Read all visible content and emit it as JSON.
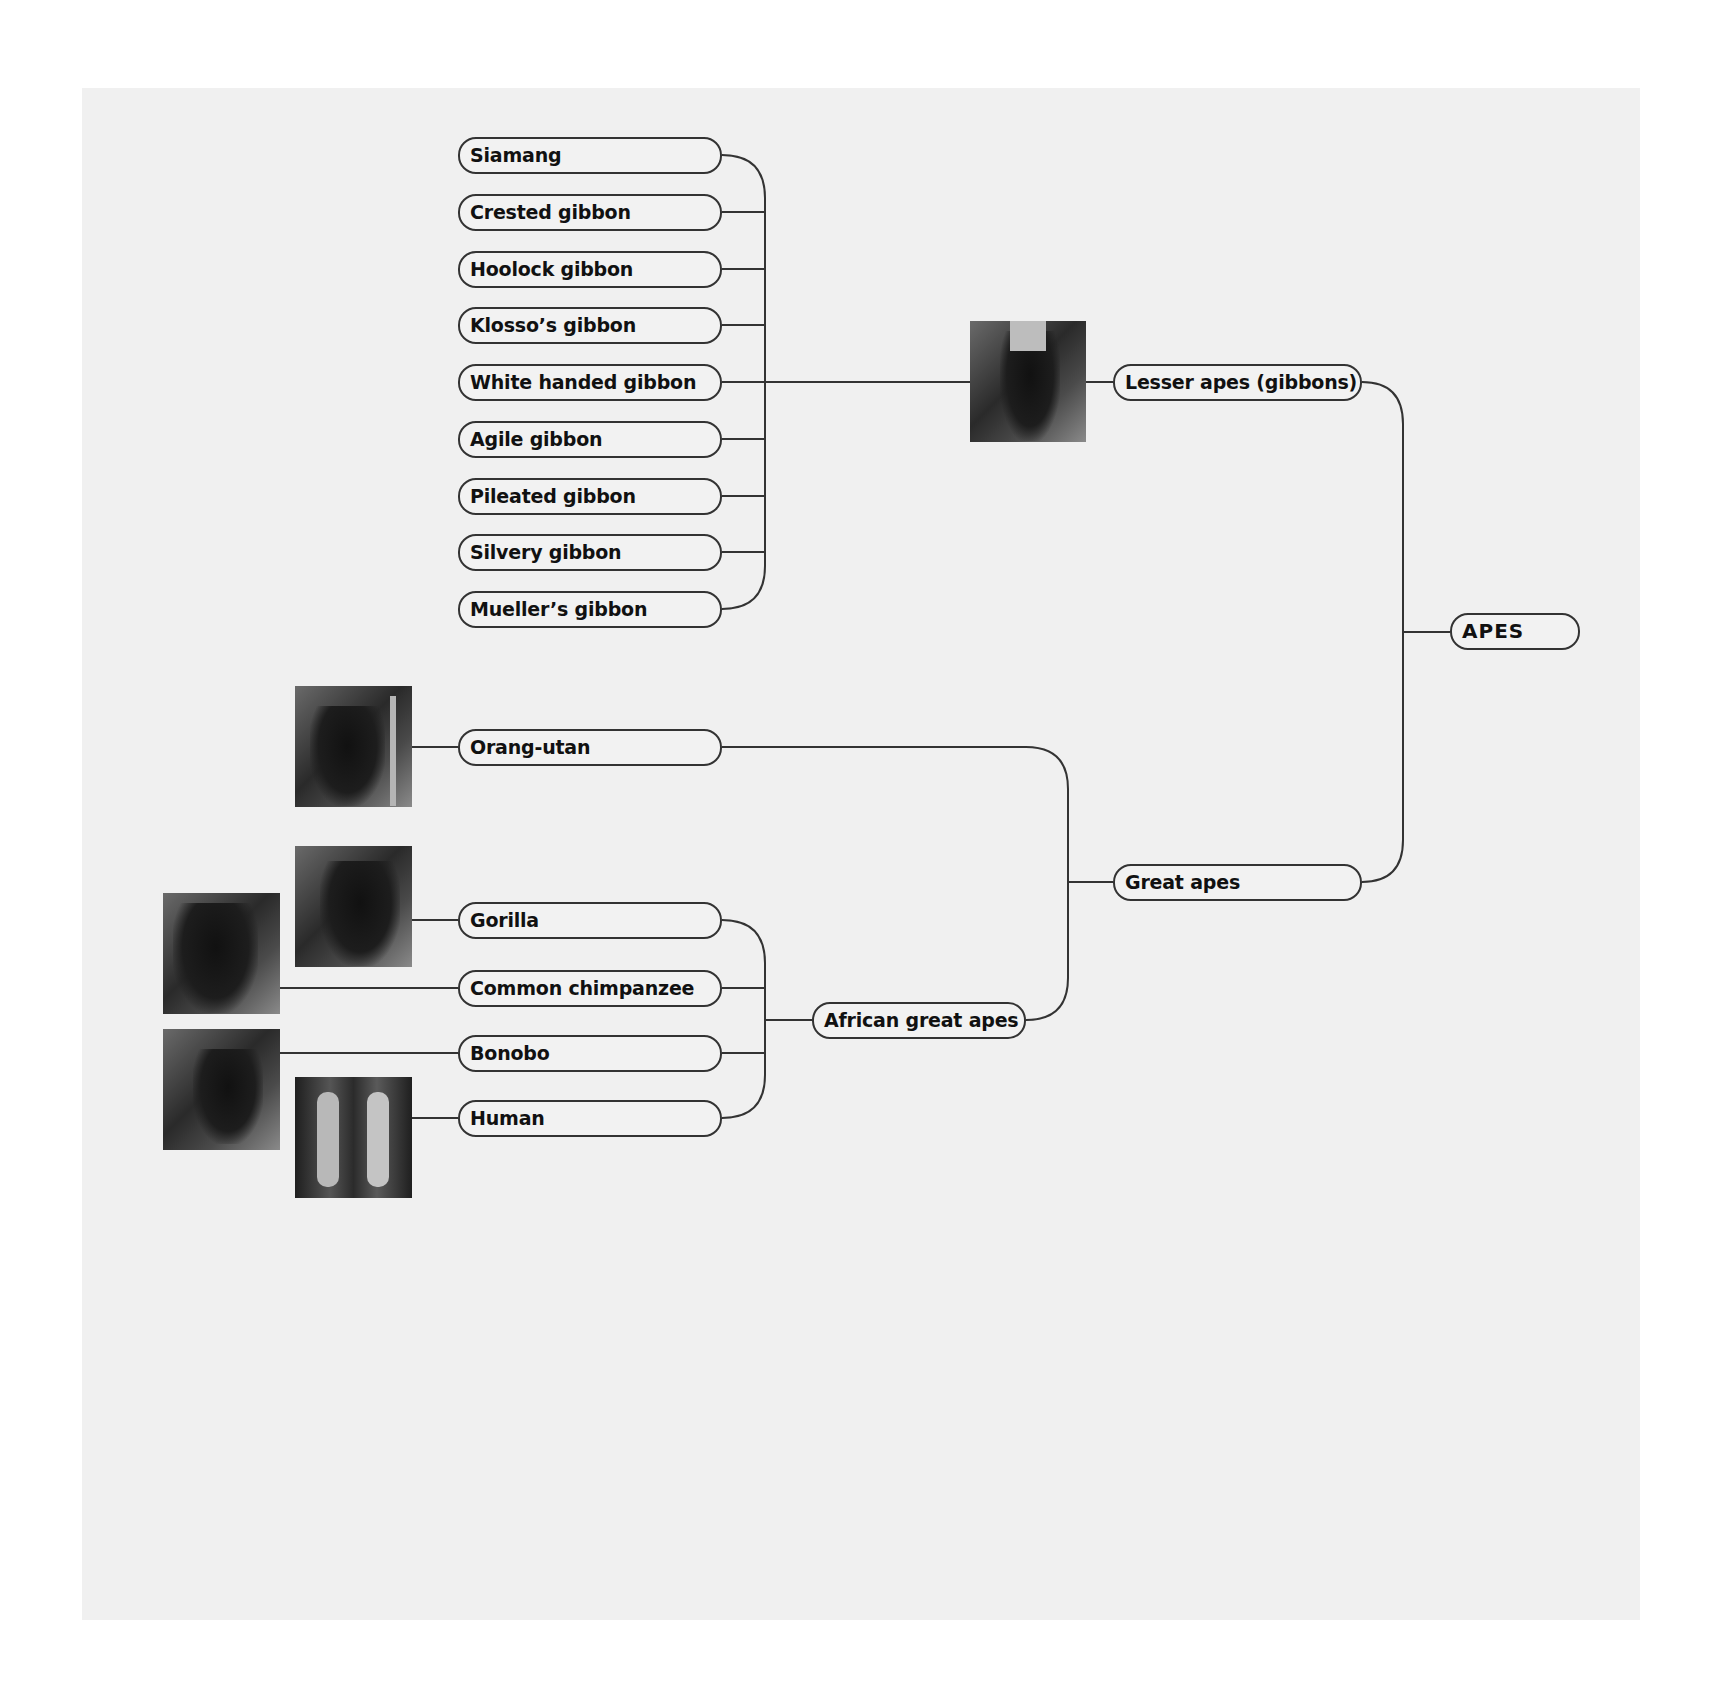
{
  "diagram": {
    "root": {
      "label": "APES"
    },
    "branches": [
      {
        "label": "Lesser apes (gibbons)",
        "image": "gibbon-photo",
        "children": [
          {
            "label": "Siamang"
          },
          {
            "label": "Crested gibbon"
          },
          {
            "label": "Hoolock gibbon"
          },
          {
            "label": "Klosso’s gibbon"
          },
          {
            "label": "White handed gibbon"
          },
          {
            "label": "Agile gibbon"
          },
          {
            "label": "Pileated gibbon"
          },
          {
            "label": "Silvery gibbon"
          },
          {
            "label": "Mueller’s gibbon"
          }
        ]
      },
      {
        "label": "Great apes",
        "children": [
          {
            "label": "Orang-utan",
            "image": "orangutan-photo"
          },
          {
            "label": "African great apes",
            "children": [
              {
                "label": "Gorilla",
                "image": "gorilla-photo"
              },
              {
                "label": "Common chimpanzee",
                "image": "chimpanzee-photo"
              },
              {
                "label": "Bonobo",
                "image": "bonobo-photo"
              },
              {
                "label": "Human",
                "image": "human-photo"
              }
            ]
          }
        ]
      }
    ]
  },
  "colors": {
    "background": "#ffffff",
    "panel": "#f0f0f0",
    "line": "#333333",
    "text": "#111111"
  }
}
